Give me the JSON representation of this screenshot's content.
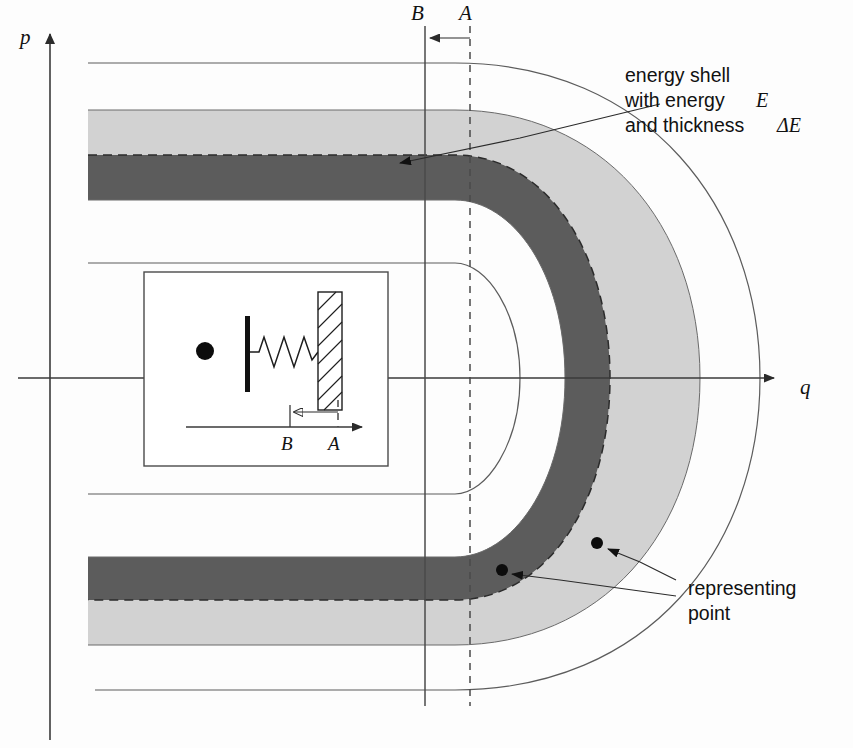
{
  "figure": {
    "background": "#fdfdfd"
  },
  "axes": {
    "vertical_label": "p",
    "horizontal_label": "q",
    "vertical_axis": {
      "x": 50,
      "y_top": 30,
      "y_bottom": 740
    },
    "horizontal_axis": {
      "y": 378,
      "x_left": 18,
      "x_right": 782
    }
  },
  "markers": {
    "wall_b": {
      "label": "B",
      "x": 425,
      "style": "solid",
      "y_top": 26,
      "y_bottom": 706
    },
    "wall_a": {
      "label": "A",
      "x": 470,
      "style": "dashed",
      "y_top": 26,
      "y_bottom": 706
    },
    "arrow_direction": "left",
    "arrow_y": 38
  },
  "bands": {
    "light": {
      "color": "#d2d2d2",
      "name": "outer energy shell layer"
    },
    "dark": {
      "color": "#5c5c5c",
      "name": "inner energy shell layer"
    },
    "mid_dash": {
      "color": "#2b2b2b",
      "name": "constant energy contour E"
    },
    "outer_guide": {
      "color": "#5c5c5c",
      "name": "outer boundary curve"
    },
    "inner_guide": {
      "color": "#5c5c5c",
      "name": "inner boundary curve"
    }
  },
  "annotations": {
    "energy_shell": {
      "lines": [
        "energy shell",
        "with energy",
        "and thickness"
      ],
      "math_1": "E",
      "math_2": "ΔE",
      "x": 625,
      "y": 75
    },
    "representing_point": {
      "lines": [
        "representing",
        "point"
      ],
      "x": 688,
      "y": 588
    }
  },
  "representing_points": [
    {
      "cx": 502,
      "cy": 570,
      "r": 6
    },
    {
      "cx": 597,
      "cy": 543,
      "r": 6
    }
  ],
  "inset": {
    "name": "oscillator-with-movable-wall",
    "box": {
      "x": 144,
      "y": 272,
      "w": 244,
      "h": 194
    },
    "particle": {
      "cx": 205,
      "cy": 351,
      "r": 9
    },
    "fixed_wall": {
      "x": 248,
      "y_top": 318,
      "y_bottom": 390
    },
    "spring": {
      "x_start": 252,
      "x_end": 318,
      "y": 352,
      "coils": 6
    },
    "piston": {
      "x": 318,
      "y": 292,
      "w": 24,
      "h": 118
    },
    "axis": {
      "y": 427,
      "x_left": 186,
      "x_right": 370
    },
    "arrow": {
      "from_x": 338,
      "to_x": 292,
      "y": 412,
      "direction": "left"
    },
    "label_b": {
      "text": "B",
      "x": 286,
      "y": 450
    },
    "label_a": {
      "text": "A",
      "x": 332,
      "y": 450
    }
  }
}
